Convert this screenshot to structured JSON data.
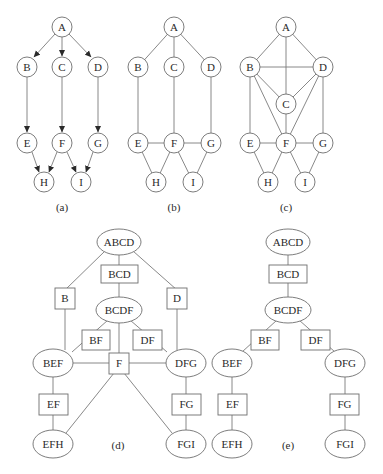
{
  "figure": {
    "panels": [
      {
        "id": "a",
        "caption": "(a)",
        "type": "directed-graph",
        "nodes": [
          "A",
          "B",
          "C",
          "D",
          "E",
          "F",
          "G",
          "H",
          "I"
        ],
        "edges": [
          [
            "A",
            "B"
          ],
          [
            "A",
            "C"
          ],
          [
            "A",
            "D"
          ],
          [
            "B",
            "E"
          ],
          [
            "C",
            "F"
          ],
          [
            "D",
            "G"
          ],
          [
            "E",
            "H"
          ],
          [
            "F",
            "H"
          ],
          [
            "F",
            "I"
          ],
          [
            "G",
            "I"
          ]
        ]
      },
      {
        "id": "b",
        "caption": "(b)",
        "type": "moral-graph",
        "nodes": [
          "A",
          "B",
          "C",
          "D",
          "E",
          "F",
          "G",
          "H",
          "I"
        ],
        "edges": [
          [
            "A",
            "B"
          ],
          [
            "A",
            "C"
          ],
          [
            "A",
            "D"
          ],
          [
            "B",
            "E"
          ],
          [
            "C",
            "F"
          ],
          [
            "D",
            "G"
          ],
          [
            "E",
            "F"
          ],
          [
            "F",
            "G"
          ],
          [
            "E",
            "H"
          ],
          [
            "F",
            "H"
          ],
          [
            "F",
            "I"
          ],
          [
            "G",
            "I"
          ]
        ]
      },
      {
        "id": "c",
        "caption": "(c)",
        "type": "triangulated-graph",
        "nodes": [
          "A",
          "B",
          "C",
          "D",
          "E",
          "F",
          "G",
          "H",
          "I"
        ],
        "edges": [
          [
            "A",
            "B"
          ],
          [
            "A",
            "C"
          ],
          [
            "A",
            "D"
          ],
          [
            "B",
            "D"
          ],
          [
            "B",
            "C"
          ],
          [
            "C",
            "D"
          ],
          [
            "B",
            "F"
          ],
          [
            "C",
            "F"
          ],
          [
            "D",
            "F"
          ],
          [
            "B",
            "E"
          ],
          [
            "D",
            "G"
          ],
          [
            "E",
            "F"
          ],
          [
            "F",
            "G"
          ],
          [
            "E",
            "H"
          ],
          [
            "F",
            "H"
          ],
          [
            "F",
            "I"
          ],
          [
            "G",
            "I"
          ]
        ]
      },
      {
        "id": "d",
        "caption": "(d)",
        "type": "junction-graph",
        "cliques": [
          "ABCD",
          "BCDF",
          "BEF",
          "DFG",
          "EFH",
          "FGI"
        ],
        "separators": [
          "BCD",
          "B",
          "D",
          "BF",
          "DF",
          "F",
          "EF",
          "FG"
        ]
      },
      {
        "id": "e",
        "caption": "(e)",
        "type": "junction-tree",
        "cliques": [
          "ABCD",
          "BCDF",
          "BEF",
          "DFG",
          "EFH",
          "FGI"
        ],
        "separators": [
          "BCD",
          "BF",
          "DF",
          "EF",
          "FG"
        ]
      }
    ]
  },
  "labels": {
    "A": "A",
    "B": "B",
    "C": "C",
    "D": "D",
    "E": "E",
    "F": "F",
    "G": "G",
    "H": "H",
    "I": "I",
    "ABCD": "ABCD",
    "BCD": "BCD",
    "BCDF": "BCDF",
    "BF": "BF",
    "DF": "DF",
    "BEF": "BEF",
    "DFG": "DFG",
    "EF": "EF",
    "FG": "FG",
    "EFH": "EFH",
    "FGI": "FGI"
  },
  "captions": {
    "a": "(a)",
    "b": "(b)",
    "c": "(c)",
    "d": "(d)",
    "e": "(e)"
  }
}
